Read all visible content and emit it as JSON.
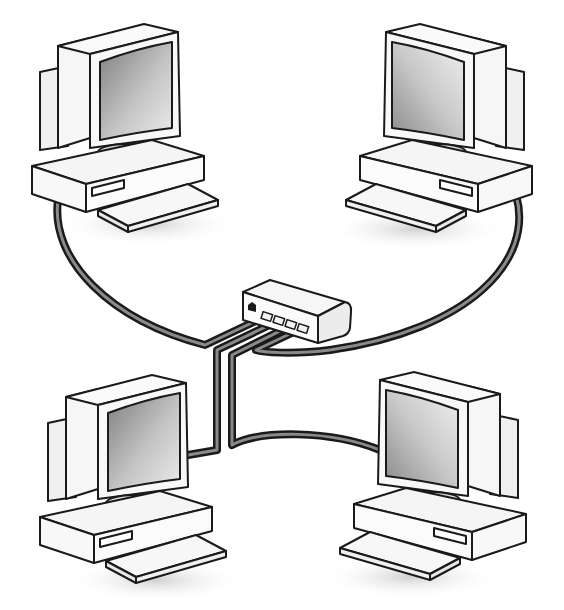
{
  "diagram": {
    "type": "network-star-topology",
    "colors": {
      "background": "#ffffff",
      "outline": "#1a1a1a",
      "cable": "#3a3a3a",
      "cable_highlight": "#9a9a9a",
      "screen_dark": "#8c8c8c",
      "screen_light": "#e6e6e6",
      "case": "#f4f4f4",
      "shadow": "#dcdcdc"
    },
    "nodes": [
      {
        "id": "computer-top-left",
        "kind": "computer",
        "facing": "right"
      },
      {
        "id": "computer-top-right",
        "kind": "computer",
        "facing": "left"
      },
      {
        "id": "computer-bottom-left",
        "kind": "computer",
        "facing": "right"
      },
      {
        "id": "computer-bottom-right",
        "kind": "computer",
        "facing": "left"
      },
      {
        "id": "hub",
        "kind": "hub",
        "ports": 4
      }
    ],
    "edges": [
      {
        "from": "computer-top-left",
        "to": "hub"
      },
      {
        "from": "computer-top-right",
        "to": "hub"
      },
      {
        "from": "computer-bottom-left",
        "to": "hub"
      },
      {
        "from": "computer-bottom-right",
        "to": "hub"
      }
    ]
  }
}
